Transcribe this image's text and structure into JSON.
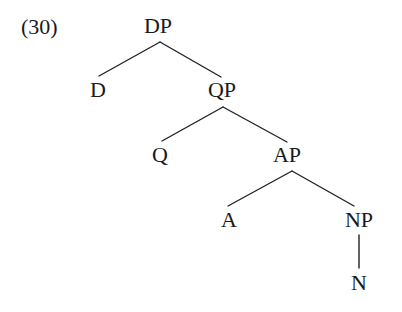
{
  "example_number": "(30)",
  "tree": {
    "nodes": {
      "dp": {
        "label": "DP",
        "x": 158,
        "y": 15
      },
      "d": {
        "label": "D",
        "x": 98,
        "y": 79
      },
      "qp": {
        "label": "QP",
        "x": 222,
        "y": 79
      },
      "q": {
        "label": "Q",
        "x": 160,
        "y": 144
      },
      "ap": {
        "label": "AP",
        "x": 287,
        "y": 144
      },
      "a": {
        "label": "A",
        "x": 229,
        "y": 209
      },
      "np": {
        "label": "NP",
        "x": 359,
        "y": 209
      },
      "n": {
        "label": "N",
        "x": 359,
        "y": 272
      }
    },
    "edges": [
      {
        "from": "dp",
        "to": "d",
        "x1": 160,
        "y1": 42,
        "x2": 99,
        "y2": 76
      },
      {
        "from": "dp",
        "to": "qp",
        "x1": 160,
        "y1": 42,
        "x2": 221,
        "y2": 77
      },
      {
        "from": "qp",
        "to": "q",
        "x1": 223,
        "y1": 107,
        "x2": 162,
        "y2": 141
      },
      {
        "from": "qp",
        "to": "ap",
        "x1": 223,
        "y1": 107,
        "x2": 287,
        "y2": 142
      },
      {
        "from": "ap",
        "to": "a",
        "x1": 292,
        "y1": 171,
        "x2": 228,
        "y2": 206
      },
      {
        "from": "ap",
        "to": "np",
        "x1": 292,
        "y1": 171,
        "x2": 354,
        "y2": 206
      },
      {
        "from": "np",
        "to": "n",
        "x1": 359,
        "y1": 235,
        "x2": 359,
        "y2": 268
      }
    ]
  },
  "colors": {
    "text": "#1a1a1a",
    "edge": "#222222",
    "background": "#ffffff"
  }
}
